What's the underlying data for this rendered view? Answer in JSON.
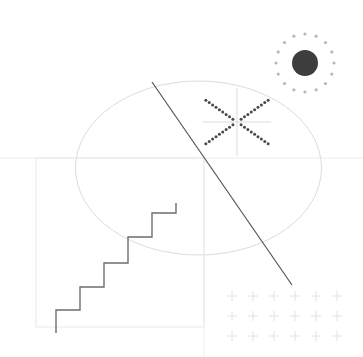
{
  "canvas": {
    "width": 363,
    "height": 357,
    "background": "#ffffff",
    "title": "Abstract geometric composition"
  },
  "palette": {
    "paper": "#ffffff",
    "hairline": "#e8e8e8",
    "hairline_soft": "#ededed",
    "ellipse_stroke": "#dcdcdc",
    "stair_stroke": "#6e6e6e",
    "diagonal_stroke": "#555555",
    "dot_dark": "#4a4a4a",
    "disc_fill": "#3d3d3d",
    "speck": "#b9b9b9",
    "plus_stroke": "#e2e2e2"
  },
  "shapes": {
    "axis_horizontal": {
      "name": "Horizontal hairline",
      "x1": 0,
      "y1": 158,
      "x2": 363,
      "y2": 158,
      "stroke": "#ededed",
      "width": 1
    },
    "axis_vertical": {
      "name": "Vertical hairline",
      "x1": 204,
      "y1": 155,
      "x2": 204,
      "y2": 357,
      "stroke": "#ededed",
      "width": 1
    },
    "ellipse": {
      "name": "Large ellipse",
      "cx": 198.5,
      "cy": 168,
      "rx": 123,
      "ry": 87,
      "stroke": "#dcdcdc",
      "width": 1,
      "fill": "none"
    },
    "square": {
      "name": "Square outline",
      "x": 36,
      "y": 158,
      "width": 168,
      "height": 169,
      "stroke": "#e8e8e8",
      "stroke_width": 1,
      "fill": "none"
    },
    "diagonal": {
      "name": "Diagonal slash",
      "x1": 152,
      "y1": 82,
      "x2": 292,
      "y2": 285,
      "stroke": "#555555",
      "width": 1.2
    },
    "staircase": {
      "name": "Five step staircase",
      "stroke": "#6e6e6e",
      "width": 1.4,
      "fill": "none",
      "points": "56,333 56,310 80,310 80,287 104,287 104,263 128,263 128,237 152,237 152,213 176,213 176,203 "
    },
    "sun": {
      "name": "Sun disc with halo dots",
      "cx": 305,
      "cy": 63,
      "disc_radius": 13,
      "disc_fill": "#3d3d3d",
      "halo_radius": 29,
      "halo_dot_count": 16,
      "halo_dot_radius": 1.6,
      "halo_dot_fill": "#b9b9b9"
    },
    "asterisk": {
      "name": "Six spoke dotted asterisk",
      "cx": 237,
      "cy": 122,
      "arm_length": 38,
      "dot_radius": 1.5,
      "dot_fill": "#4a4a4a",
      "dots_per_arm": 9,
      "dot_start_offset": 5,
      "diagonal_angles_deg": [
        35,
        145,
        215,
        325
      ],
      "cross_stroke": "#dcdcdc",
      "cross_width": 1,
      "cross_half_length": 34
    },
    "plus_grid": {
      "name": "Plus sign grid",
      "origin_x": 232,
      "origin_y": 296,
      "columns": 6,
      "rows": 3,
      "step_x": 21,
      "step_y": 20,
      "arm": 5,
      "stroke": "#e2e2e2",
      "width": 1
    }
  },
  "labels": {
    "sun_icon": "sun-icon",
    "asterisk_icon": "asterisk-icon",
    "plus_grid_icon": "plus-grid-icon",
    "staircase_icon": "staircase-icon",
    "ellipse_icon": "ellipse-icon",
    "square_icon": "square-icon",
    "diagonal_icon": "diagonal-line-icon"
  }
}
